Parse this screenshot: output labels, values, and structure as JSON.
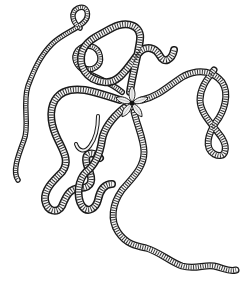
{
  "image": {
    "subject": "Line drawing of a brittle star (ophiuroid) with long, coiling segmented arms radiating from a five-lobed central disc",
    "style": "black ink stipple/line art on white",
    "background_color": "#ffffff",
    "ink_color": "#1a1a1a"
  },
  "figure": {
    "central_disc": {
      "cx": 132,
      "cy": 103,
      "lobes": 5
    },
    "arms": [
      {
        "name": "upper-left-arm",
        "description": "coils upward into a spiral tip at top-left"
      },
      {
        "name": "upper-arm",
        "description": "rises toward top-center then curls down to a small hook"
      },
      {
        "name": "right-arm",
        "description": "extends right and forms a figure-eight loop"
      },
      {
        "name": "lower-arm",
        "description": "descends and trails off as a long thin wavy tail toward bottom-right"
      },
      {
        "name": "left-arm",
        "description": "loops left through several large meanders"
      }
    ]
  }
}
